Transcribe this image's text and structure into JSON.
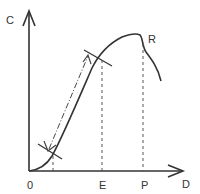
{
  "diagram": {
    "axes": {
      "y_label": "C",
      "x_label": "D",
      "origin_label": "0"
    },
    "points": {
      "E": "E",
      "P": "P",
      "R": "R"
    },
    "colors": {
      "line": "#333333",
      "dashed": "#555555"
    }
  }
}
